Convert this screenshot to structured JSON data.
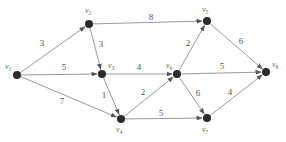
{
  "graph": {
    "type": "directed-weighted-graph",
    "nodes": [
      {
        "id": "v1",
        "label": "v",
        "sub": "1",
        "x": 17,
        "y": 75,
        "lx": 5,
        "ly": 69
      },
      {
        "id": "v2",
        "label": "v",
        "sub": "2",
        "x": 89,
        "y": 24,
        "lx": 85,
        "ly": 13
      },
      {
        "id": "v3",
        "label": "v",
        "sub": "3",
        "x": 102,
        "y": 74,
        "lx": 108,
        "ly": 68
      },
      {
        "id": "v4",
        "label": "v",
        "sub": "4",
        "x": 121,
        "y": 119,
        "lx": 116,
        "ly": 132
      },
      {
        "id": "v5",
        "label": "v",
        "sub": "5",
        "x": 207,
        "y": 21,
        "lx": 202,
        "ly": 12
      },
      {
        "id": "v6",
        "label": "v",
        "sub": "6",
        "x": 177,
        "y": 74,
        "lx": 166,
        "ly": 68
      },
      {
        "id": "v7",
        "label": "v",
        "sub": "7",
        "x": 207,
        "y": 118,
        "lx": 202,
        "ly": 132
      },
      {
        "id": "v8",
        "label": "v",
        "sub": "8",
        "x": 266,
        "y": 72,
        "lx": 272,
        "ly": 67
      }
    ],
    "edges": [
      {
        "from": "v1",
        "to": "v2",
        "weight": "3",
        "wx": 42,
        "wy": 46
      },
      {
        "from": "v1",
        "to": "v3",
        "weight": "5",
        "wx": 64,
        "wy": 70
      },
      {
        "from": "v1",
        "to": "v4",
        "weight": "7",
        "wx": 62,
        "wy": 104
      },
      {
        "from": "v2",
        "to": "v3",
        "weight": "3",
        "wx": 101,
        "wy": 47
      },
      {
        "from": "v2",
        "to": "v5",
        "weight": "8",
        "wx": 151,
        "wy": 20
      },
      {
        "from": "v3",
        "to": "v4",
        "weight": "1",
        "wx": 104,
        "wy": 98
      },
      {
        "from": "v3",
        "to": "v6",
        "weight": "4",
        "wx": 139,
        "wy": 70
      },
      {
        "from": "v4",
        "to": "v6",
        "weight": "2",
        "wx": 143,
        "wy": 95
      },
      {
        "from": "v4",
        "to": "v7",
        "weight": "5",
        "wx": 161,
        "wy": 116
      },
      {
        "from": "v6",
        "to": "v5",
        "weight": "2",
        "wx": 188,
        "wy": 46
      },
      {
        "from": "v6",
        "to": "v8",
        "weight": "5",
        "wx": 222,
        "wy": 69
      },
      {
        "from": "v6",
        "to": "v7",
        "weight": "6",
        "wx": 198,
        "wy": 96
      },
      {
        "from": "v5",
        "to": "v8",
        "weight": "6",
        "wx": 241,
        "wy": 44
      },
      {
        "from": "v7",
        "to": "v8",
        "weight": "4",
        "wx": 230,
        "wy": 95
      }
    ]
  },
  "colors": {
    "edge": "#9a9a9a",
    "node": "#2b2b2b",
    "text": "#555555"
  }
}
